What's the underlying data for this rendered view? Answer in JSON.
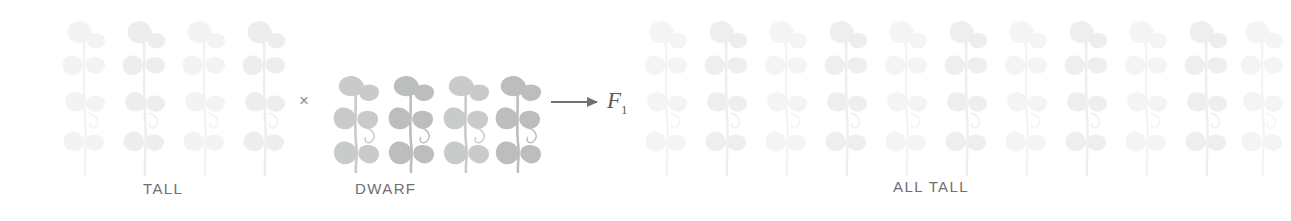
{
  "figure": {
    "background_color": "#ffffff",
    "width": 1291,
    "height": 221
  },
  "groups": {
    "parent_tall": {
      "label": "TALL",
      "label_x": 143,
      "label_y": 180,
      "count": 4,
      "plant_type": "tall",
      "tone": "#f2f3f4",
      "tone_dark": "#eceded",
      "positions": [
        58,
        118,
        178,
        238
      ]
    },
    "parent_dwarf": {
      "label": "DWARF",
      "label_x": 355,
      "label_y": 180,
      "count": 4,
      "plant_type": "dwarf",
      "tone": "#c9cbcb",
      "tone_dark": "#bcbebe",
      "positions": [
        330,
        385,
        440,
        492
      ]
    },
    "offspring_all_tall": {
      "label": "ALL TALL",
      "label_x": 893,
      "label_y": 178,
      "count": 11,
      "plant_type": "tall",
      "tone": "#f3f4f5",
      "tone_dark": "#edeeef",
      "positions": [
        640,
        700,
        760,
        820,
        880,
        940,
        1000,
        1060,
        1120,
        1180,
        1236
      ]
    }
  },
  "symbols": {
    "cross": {
      "glyph": "×",
      "x": 299,
      "y": 92,
      "color": "#8d8d8d"
    },
    "arrow": {
      "x": 551,
      "y": 89,
      "color": "#707070"
    },
    "generation_label": {
      "letter": "F",
      "subscript": "1",
      "x": 612,
      "y": 82,
      "color": "#5d5d5d"
    }
  }
}
